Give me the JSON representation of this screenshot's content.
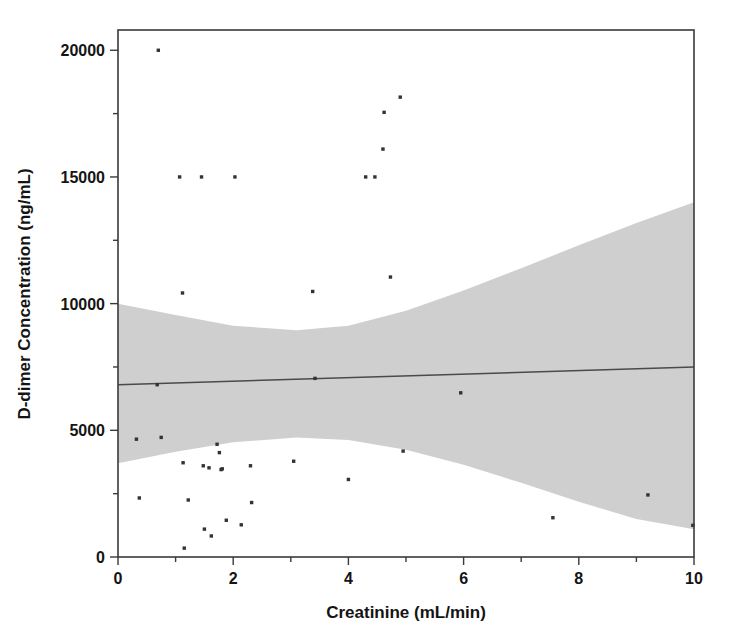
{
  "chart_data": {
    "type": "scatter",
    "title": "",
    "xlabel": "Creatinine (mL/min)",
    "ylabel": "D-dimer Concentration (ng/mL)",
    "xlim": [
      0,
      10
    ],
    "ylim": [
      0,
      20800
    ],
    "xticks": [
      0,
      2,
      4,
      6,
      8,
      10
    ],
    "xtick_labels": [
      "0",
      "2",
      "4",
      "6",
      "8",
      "10"
    ],
    "xticks_minor": [
      1,
      3,
      5,
      7,
      9
    ],
    "yticks": [
      0,
      5000,
      10000,
      15000,
      20000
    ],
    "ytick_labels": [
      "0",
      "5000",
      "10000",
      "15000",
      "20000"
    ],
    "yticks_minor": [
      2500,
      7500,
      12500,
      17500
    ],
    "grid": false,
    "legend": null,
    "point_color": "#333333",
    "line_color": "#4a4a4a",
    "band_color": "#cfcfcf",
    "frame_color": "#3a3a3a",
    "points": [
      {
        "x": 0.32,
        "y": 4650
      },
      {
        "x": 0.37,
        "y": 2330
      },
      {
        "x": 0.68,
        "y": 6800
      },
      {
        "x": 0.7,
        "y": 20000
      },
      {
        "x": 0.75,
        "y": 4720
      },
      {
        "x": 1.07,
        "y": 15000
      },
      {
        "x": 1.12,
        "y": 10420
      },
      {
        "x": 1.13,
        "y": 3720
      },
      {
        "x": 1.15,
        "y": 350
      },
      {
        "x": 1.22,
        "y": 2250
      },
      {
        "x": 1.45,
        "y": 15000
      },
      {
        "x": 1.48,
        "y": 3600
      },
      {
        "x": 1.5,
        "y": 1100
      },
      {
        "x": 1.58,
        "y": 3520
      },
      {
        "x": 1.62,
        "y": 830
      },
      {
        "x": 1.72,
        "y": 4450
      },
      {
        "x": 1.76,
        "y": 4120
      },
      {
        "x": 1.79,
        "y": 3450
      },
      {
        "x": 1.81,
        "y": 3480
      },
      {
        "x": 1.88,
        "y": 1450
      },
      {
        "x": 2.03,
        "y": 15000
      },
      {
        "x": 2.14,
        "y": 1270
      },
      {
        "x": 2.3,
        "y": 3600
      },
      {
        "x": 2.32,
        "y": 2150
      },
      {
        "x": 3.05,
        "y": 3780
      },
      {
        "x": 3.38,
        "y": 10480
      },
      {
        "x": 3.42,
        "y": 7050
      },
      {
        "x": 4.0,
        "y": 3060
      },
      {
        "x": 4.3,
        "y": 15000
      },
      {
        "x": 4.46,
        "y": 15000
      },
      {
        "x": 4.6,
        "y": 16100
      },
      {
        "x": 4.62,
        "y": 17550
      },
      {
        "x": 4.73,
        "y": 11050
      },
      {
        "x": 4.9,
        "y": 18150
      },
      {
        "x": 4.95,
        "y": 4180
      },
      {
        "x": 5.95,
        "y": 6480
      },
      {
        "x": 7.55,
        "y": 1550
      },
      {
        "x": 9.2,
        "y": 2450
      },
      {
        "x": 9.98,
        "y": 1250
      }
    ],
    "fit_line": {
      "x_start": 0,
      "y_start": 6800,
      "x_end": 10,
      "y_end": 7500
    },
    "confidence_band": {
      "x": [
        0,
        1,
        2,
        3.1,
        4,
        5,
        6,
        7,
        8,
        9,
        10
      ],
      "upper": [
        10000,
        9550,
        9130,
        8950,
        9130,
        9720,
        10520,
        11400,
        12300,
        13180,
        14000
      ],
      "lower": [
        3700,
        4150,
        4530,
        4720,
        4620,
        4230,
        3640,
        2930,
        2180,
        1500,
        1100
      ]
    }
  }
}
